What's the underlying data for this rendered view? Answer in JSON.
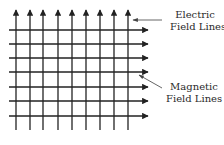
{
  "diagram": {
    "line_color": "#222222",
    "vertical_lines": {
      "name": "Electric Field Lines",
      "direction": "up",
      "x": [
        16,
        30,
        43,
        58,
        72,
        86,
        100,
        114,
        128
      ],
      "y_start": 130,
      "y_end": 10
    },
    "horizontal_lines": {
      "name": "Magnetic Field Lines",
      "direction": "right",
      "y": [
        30,
        44,
        58,
        72,
        87,
        101,
        116
      ],
      "x_start": 9,
      "x_end": 148
    },
    "labels": {
      "electric": {
        "line1": "Electric",
        "line2": "Field Lines"
      },
      "magnetic": {
        "line1": "Magnetic",
        "line2": "Field Lines"
      }
    }
  }
}
